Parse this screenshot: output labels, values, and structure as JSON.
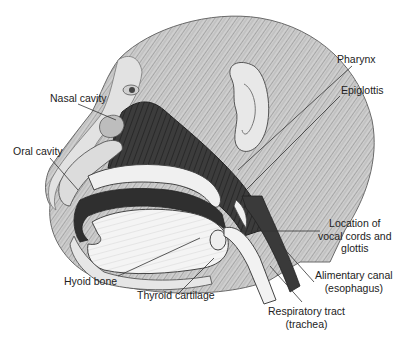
{
  "figure": {
    "colors": {
      "background": "#ffffff",
      "ink": "#222222",
      "fur": "#9a9a9a",
      "cavity": "#3a3a3a",
      "tissue": "#f2f2f2"
    }
  },
  "labels": {
    "nasal_cavity": "Nasal cavity",
    "oral_cavity": "Oral cavity",
    "pharynx": "Pharynx",
    "epiglottis": "Epiglottis",
    "vocal_cords": [
      "Location of",
      "vocal cords and",
      "glottis"
    ],
    "alimentary_canal": [
      "Alimentary canal",
      "(esophagus)"
    ],
    "respiratory_tract": [
      "Respiratory tract",
      "(trachea)"
    ],
    "hyoid_bone": "Hyoid bone",
    "thyroid_cartilage": "Thyroid cartilage"
  }
}
